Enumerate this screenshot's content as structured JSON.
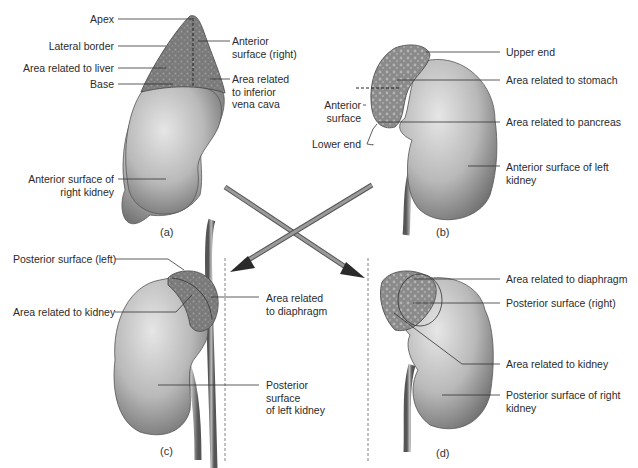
{
  "figure": {
    "panels": [
      {
        "id": "a",
        "caption": "(a)",
        "title": "Right suprarenal gland, anterior view",
        "labels": {
          "apex": "Apex",
          "lateral_border": "Lateral border",
          "area_liver": "Area related to liver",
          "base": "Base",
          "anterior_surface_1": "Anterior",
          "anterior_surface_2": "surface (right)",
          "ivc_1": "Area related",
          "ivc_2": "to inferior",
          "ivc_3": "vena cava",
          "kidney_1": "Anterior surface of",
          "kidney_2": "right kidney"
        }
      },
      {
        "id": "b",
        "caption": "(b)",
        "labels": {
          "upper_end": "Upper end",
          "stomach": "Area related to stomach",
          "anterior_1": "Anterior",
          "anterior_2": "surface",
          "pancreas": "Area related to pancreas",
          "lower_end": "Lower end",
          "kidney_1": "Anterior surface of left",
          "kidney_2": "kidney"
        }
      },
      {
        "id": "c",
        "caption": "(c)",
        "labels": {
          "posterior_left": "Posterior surface (left)",
          "kidney_area": "Area related to kidney",
          "diaphragm_1": "Area related",
          "diaphragm_2": "to diaphragm",
          "kidney_1": "Posterior",
          "kidney_2": "surface",
          "kidney_3": "of left kidney"
        }
      },
      {
        "id": "d",
        "caption": "(d)",
        "labels": {
          "diaphragm": "Area related to diaphragm",
          "posterior_right": "Posterior surface (right)",
          "kidney_area": "Area related to kidney",
          "kidney_1": "Posterior surface of right",
          "kidney_2": "kidney"
        }
      }
    ],
    "colors": {
      "kidney_light": "#d9d9d9",
      "kidney_mid": "#a8a8a8",
      "kidney_dark": "#6e6e6e",
      "gland_dark": "#6f6f6f",
      "gland_light": "#9a9a9a",
      "leader_line": "#333333",
      "arrow": "#7a7a7a"
    }
  }
}
